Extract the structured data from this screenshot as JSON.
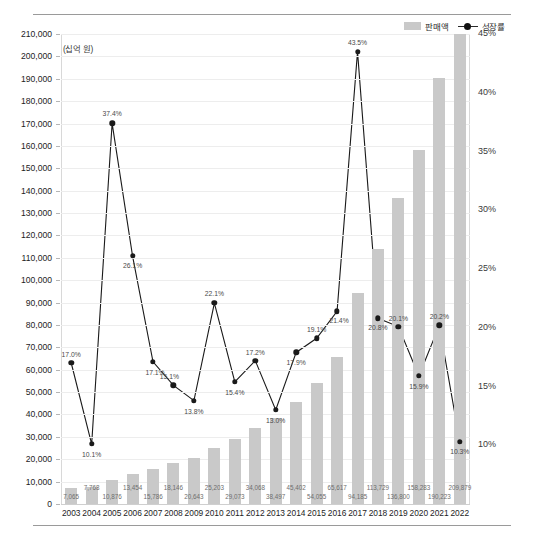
{
  "legend": {
    "items": [
      {
        "name": "sales-legend",
        "label": "판매액",
        "marker": "bar-swatch",
        "color": "#c9c9c9"
      },
      {
        "name": "growth-legend",
        "label": "성장률",
        "marker": "line-dot",
        "color": "#1a1a1a"
      }
    ]
  },
  "unit_note": "(십억 원)",
  "chart_data": {
    "type": "bar",
    "title": "",
    "subtitle": "",
    "xlabel": "",
    "ylabel": "(십억 원)",
    "grid": true,
    "legend_position": "top-right",
    "categories": [
      "2003",
      "2004",
      "2005",
      "2006",
      "2007",
      "2008",
      "2009",
      "2010",
      "2011",
      "2012",
      "2013",
      "2014",
      "2015",
      "2016",
      "2017",
      "2018",
      "2019",
      "2020",
      "2021",
      "2022"
    ],
    "series": [
      {
        "name": "판매액",
        "type": "bar",
        "axis": "left",
        "color": "#c9c9c9",
        "values": [
          7065,
          7768,
          10876,
          13454,
          15786,
          18146,
          20643,
          25203,
          29073,
          34068,
          38497,
          45402,
          54055,
          65617,
          94185,
          113729,
          136800,
          158283,
          190223,
          209879
        ],
        "labels": [
          "7,065",
          "7,768",
          "10,876",
          "13,454",
          "15,786",
          "18,146",
          "20,643",
          "25,203",
          "29,073",
          "34,068",
          "38,497",
          "45,402",
          "54,055",
          "65,617",
          "94,185",
          "113,729",
          "136,800",
          "158,283",
          "190,223",
          "209,879"
        ]
      },
      {
        "name": "성장률",
        "type": "line",
        "axis": "right",
        "color": "#1a1a1a",
        "values": [
          17.0,
          10.1,
          37.4,
          26.1,
          17.1,
          15.1,
          13.8,
          22.1,
          15.4,
          17.2,
          13.0,
          17.9,
          19.1,
          21.4,
          43.5,
          20.8,
          20.1,
          15.9,
          20.2,
          10.3
        ],
        "labels": [
          "17.0%",
          "10.1%",
          "37.4%",
          "26.1%",
          "17.1%",
          "15.1%",
          "13.8%",
          "22.1%",
          "15.4%",
          "17.2%",
          "13.0%",
          "17.9%",
          "19.1%",
          "21.4%",
          "43.5%",
          "20.8%",
          "20.1%",
          "15.9%",
          "20.2%",
          "10.3%"
        ]
      }
    ],
    "ylim": [
      0,
      210000
    ],
    "yticks": [
      0,
      10000,
      20000,
      30000,
      40000,
      50000,
      60000,
      70000,
      80000,
      90000,
      100000,
      110000,
      120000,
      130000,
      140000,
      150000,
      160000,
      170000,
      180000,
      190000,
      200000,
      210000
    ],
    "ytick_labels": [
      "0",
      "10,000",
      "20,000",
      "30,000",
      "40,000",
      "50,000",
      "60,000",
      "70,000",
      "80,000",
      "90,000",
      "100,000",
      "110,000",
      "120,000",
      "130,000",
      "140,000",
      "150,000",
      "160,000",
      "170,000",
      "180,000",
      "190,000",
      "200,000",
      "210,000"
    ],
    "y2lim": [
      5,
      45
    ],
    "y2ticks": [
      10,
      15,
      20,
      25,
      30,
      35,
      40,
      45
    ],
    "y2tick_labels": [
      "10%",
      "15%",
      "20%",
      "25%",
      "30%",
      "35%",
      "40%",
      "45%"
    ]
  }
}
